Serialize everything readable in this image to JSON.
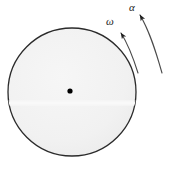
{
  "figure": {
    "background_color": "#ffffff",
    "width": 177,
    "height": 170
  },
  "disc": {
    "name": "disc",
    "center_x": 72,
    "center_y": 92,
    "radius": 64,
    "fill_color": "#f2f2f2",
    "stroke_color": "#2b2b2b",
    "stroke_width": 1.3
  },
  "center_point": {
    "name": "center-dot",
    "x": 70,
    "y": 91,
    "radius": 2.6,
    "fill_color": "#000000"
  },
  "crease_line": {
    "name": "crease-highlight",
    "y": 103,
    "color": "#fbfbfb",
    "width": 3
  },
  "arrows": [
    {
      "id": "omega",
      "label": "ω",
      "label_x": 110,
      "label_y": 25,
      "path": "M 138 73 C 133 57 128 44 121 33",
      "arrow_tip_x": 121,
      "arrow_tip_y": 33,
      "stroke_color": "#4a4a4a",
      "stroke_width": 1.1,
      "description": "angular velocity"
    },
    {
      "id": "alpha",
      "label": "α",
      "label_x": 132,
      "label_y": 11,
      "path": "M 162 73 C 156 52 150 32 140 15",
      "arrow_tip_x": 140,
      "arrow_tip_y": 15,
      "stroke_color": "#4a4a4a",
      "stroke_width": 1.1,
      "description": "angular acceleration"
    }
  ]
}
